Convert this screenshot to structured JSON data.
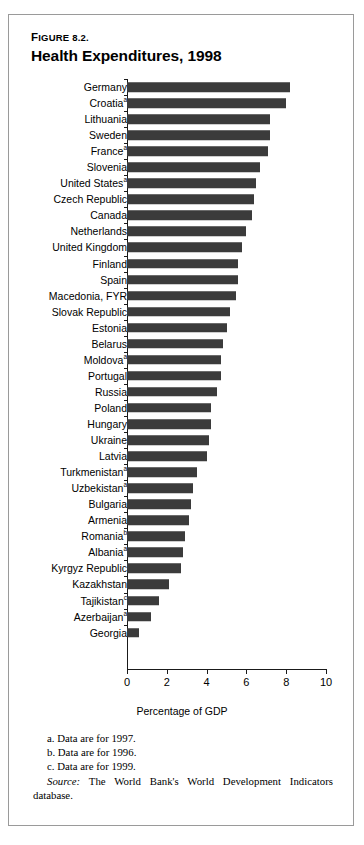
{
  "figure": {
    "number_prefix": "F",
    "number": "IGURE 8.2.",
    "number_full": "FIGURE 8.2.",
    "title": "Health Expenditures, 1998"
  },
  "notes": [
    "a. Data are for 1997.",
    "b. Data are for 1996.",
    "c. Data are for 1999."
  ],
  "source": {
    "label": "Source:",
    "text": " The World Bank's World Development Indicators database."
  },
  "colors": {
    "bar": "#3b3b3b",
    "axis": "#1a1a1a",
    "border": "#9a9a9a",
    "background": "#ffffff"
  },
  "chart_data": {
    "type": "bar",
    "orientation": "horizontal",
    "title": "Health Expenditures, 1998",
    "xlabel": "Percentage of GDP",
    "ylabel": "",
    "xlim": [
      0,
      10
    ],
    "xticks": [
      0,
      2,
      4,
      6,
      8,
      10
    ],
    "xtick_labels": [
      "0",
      "2",
      "4",
      "6",
      "8",
      "10"
    ],
    "grid": false,
    "legend": false,
    "categories": [
      "Germany",
      "Croatia",
      "Lithuania",
      "Sweden",
      "France",
      "Slovenia",
      "United States",
      "Czech Republic",
      "Canada",
      "Netherlands",
      "United Kingdom",
      "Finland",
      "Spain",
      "Macedonia, FYR",
      "Slovak Republic",
      "Estonia",
      "Belarus",
      "Moldova",
      "Portugal",
      "Russia",
      "Poland",
      "Hungary",
      "Ukraine",
      "Latvia",
      "Turkmenistan",
      "Uzbekistan",
      "Bulgaria",
      "Armenia",
      "Romania",
      "Albania",
      "Kyrgyz Republic",
      "Kazakhstan",
      "Tajikistan",
      "Azerbaijan",
      "Georgia"
    ],
    "footnote_markers": [
      "",
      "a",
      "",
      "",
      "a",
      "",
      "a",
      "",
      "",
      "",
      "",
      "",
      "",
      "",
      "",
      "",
      "",
      "a",
      "",
      "",
      "",
      "",
      "",
      "",
      "a",
      "a",
      "",
      "",
      "b",
      "a",
      "",
      "",
      "c",
      "a",
      ""
    ],
    "values": [
      8.2,
      8.0,
      7.2,
      7.2,
      7.1,
      6.7,
      6.5,
      6.4,
      6.3,
      6.0,
      5.8,
      5.6,
      5.6,
      5.5,
      5.2,
      5.0,
      4.8,
      4.7,
      4.7,
      4.5,
      4.2,
      4.2,
      4.1,
      4.0,
      3.5,
      3.3,
      3.2,
      3.1,
      2.9,
      2.8,
      2.7,
      2.1,
      1.6,
      1.2,
      0.6
    ]
  }
}
